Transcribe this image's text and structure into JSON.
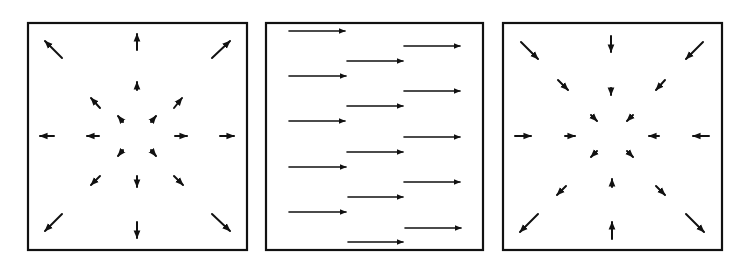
{
  "figure": {
    "ink_color": "#111111",
    "background": "#ffffff",
    "panels": [
      {
        "id": "source",
        "label": "Divergent vector field (source)",
        "frame": {
          "x": 28,
          "y": 23,
          "w": 219,
          "h": 227
        },
        "center": {
          "x": 137,
          "y": 136
        },
        "direction": "outward",
        "arrows": [
          {
            "x1": 62,
            "y1": 58,
            "x2": 45,
            "y2": 41
          },
          {
            "x1": 137,
            "y1": 50,
            "x2": 137,
            "y2": 34
          },
          {
            "x1": 212,
            "y1": 58,
            "x2": 230,
            "y2": 41
          },
          {
            "x1": 100,
            "y1": 108,
            "x2": 91,
            "y2": 98
          },
          {
            "x1": 137,
            "y1": 90,
            "x2": 137,
            "y2": 82
          },
          {
            "x1": 174,
            "y1": 108,
            "x2": 182,
            "y2": 98
          },
          {
            "x1": 123,
            "y1": 122,
            "x2": 118,
            "y2": 116
          },
          {
            "x1": 151,
            "y1": 122,
            "x2": 156,
            "y2": 116
          },
          {
            "x1": 54,
            "y1": 136,
            "x2": 40,
            "y2": 136
          },
          {
            "x1": 99,
            "y1": 136,
            "x2": 87,
            "y2": 136
          },
          {
            "x1": 175,
            "y1": 136,
            "x2": 187,
            "y2": 136
          },
          {
            "x1": 220,
            "y1": 136,
            "x2": 234,
            "y2": 136
          },
          {
            "x1": 123,
            "y1": 150,
            "x2": 118,
            "y2": 156
          },
          {
            "x1": 151,
            "y1": 150,
            "x2": 156,
            "y2": 156
          },
          {
            "x1": 137,
            "y1": 176,
            "x2": 137,
            "y2": 187
          },
          {
            "x1": 100,
            "y1": 176,
            "x2": 91,
            "y2": 185
          },
          {
            "x1": 174,
            "y1": 176,
            "x2": 183,
            "y2": 185
          },
          {
            "x1": 62,
            "y1": 214,
            "x2": 45,
            "y2": 231
          },
          {
            "x1": 137,
            "y1": 222,
            "x2": 137,
            "y2": 238
          },
          {
            "x1": 212,
            "y1": 214,
            "x2": 230,
            "y2": 231
          }
        ]
      },
      {
        "id": "uniform",
        "label": "Uniform horizontal vector field (shear/parallel flow)",
        "frame": {
          "x": 266,
          "y": 23,
          "w": 217,
          "h": 227
        },
        "direction": "rightward",
        "arrows": [
          {
            "x1": 289,
            "y1": 31,
            "x2": 345,
            "y2": 31
          },
          {
            "x1": 289,
            "y1": 76,
            "x2": 346,
            "y2": 76
          },
          {
            "x1": 289,
            "y1": 121,
            "x2": 345,
            "y2": 121
          },
          {
            "x1": 289,
            "y1": 167,
            "x2": 346,
            "y2": 167
          },
          {
            "x1": 289,
            "y1": 212,
            "x2": 346,
            "y2": 212
          },
          {
            "x1": 347,
            "y1": 61,
            "x2": 403,
            "y2": 61
          },
          {
            "x1": 347,
            "y1": 106,
            "x2": 403,
            "y2": 106
          },
          {
            "x1": 347,
            "y1": 152,
            "x2": 403,
            "y2": 152
          },
          {
            "x1": 348,
            "y1": 197,
            "x2": 403,
            "y2": 197
          },
          {
            "x1": 348,
            "y1": 242,
            "x2": 403,
            "y2": 242
          },
          {
            "x1": 404,
            "y1": 46,
            "x2": 460,
            "y2": 46
          },
          {
            "x1": 404,
            "y1": 91,
            "x2": 460,
            "y2": 91
          },
          {
            "x1": 404,
            "y1": 137,
            "x2": 460,
            "y2": 137
          },
          {
            "x1": 404,
            "y1": 182,
            "x2": 460,
            "y2": 182
          },
          {
            "x1": 405,
            "y1": 228,
            "x2": 461,
            "y2": 228
          }
        ]
      },
      {
        "id": "sink",
        "label": "Convergent vector field (sink)",
        "frame": {
          "x": 503,
          "y": 23,
          "w": 219,
          "h": 227
        },
        "center": {
          "x": 612,
          "y": 136
        },
        "direction": "inward",
        "arrows": [
          {
            "x1": 521,
            "y1": 42,
            "x2": 538,
            "y2": 59
          },
          {
            "x1": 611,
            "y1": 36,
            "x2": 611,
            "y2": 52
          },
          {
            "x1": 703,
            "y1": 42,
            "x2": 686,
            "y2": 59
          },
          {
            "x1": 558,
            "y1": 80,
            "x2": 568,
            "y2": 90
          },
          {
            "x1": 611,
            "y1": 88,
            "x2": 611,
            "y2": 95
          },
          {
            "x1": 665,
            "y1": 80,
            "x2": 656,
            "y2": 90
          },
          {
            "x1": 591,
            "y1": 115,
            "x2": 597,
            "y2": 121
          },
          {
            "x1": 633,
            "y1": 115,
            "x2": 627,
            "y2": 121
          },
          {
            "x1": 515,
            "y1": 136,
            "x2": 531,
            "y2": 136
          },
          {
            "x1": 565,
            "y1": 136,
            "x2": 575,
            "y2": 136
          },
          {
            "x1": 659,
            "y1": 136,
            "x2": 649,
            "y2": 136
          },
          {
            "x1": 709,
            "y1": 136,
            "x2": 693,
            "y2": 136
          },
          {
            "x1": 597,
            "y1": 151,
            "x2": 591,
            "y2": 157
          },
          {
            "x1": 627,
            "y1": 151,
            "x2": 633,
            "y2": 157
          },
          {
            "x1": 612,
            "y1": 187,
            "x2": 612,
            "y2": 179
          },
          {
            "x1": 566,
            "y1": 186,
            "x2": 557,
            "y2": 195
          },
          {
            "x1": 656,
            "y1": 186,
            "x2": 665,
            "y2": 195
          },
          {
            "x1": 538,
            "y1": 214,
            "x2": 520,
            "y2": 232
          },
          {
            "x1": 612,
            "y1": 239,
            "x2": 612,
            "y2": 222
          },
          {
            "x1": 686,
            "y1": 214,
            "x2": 704,
            "y2": 232
          }
        ]
      }
    ]
  }
}
